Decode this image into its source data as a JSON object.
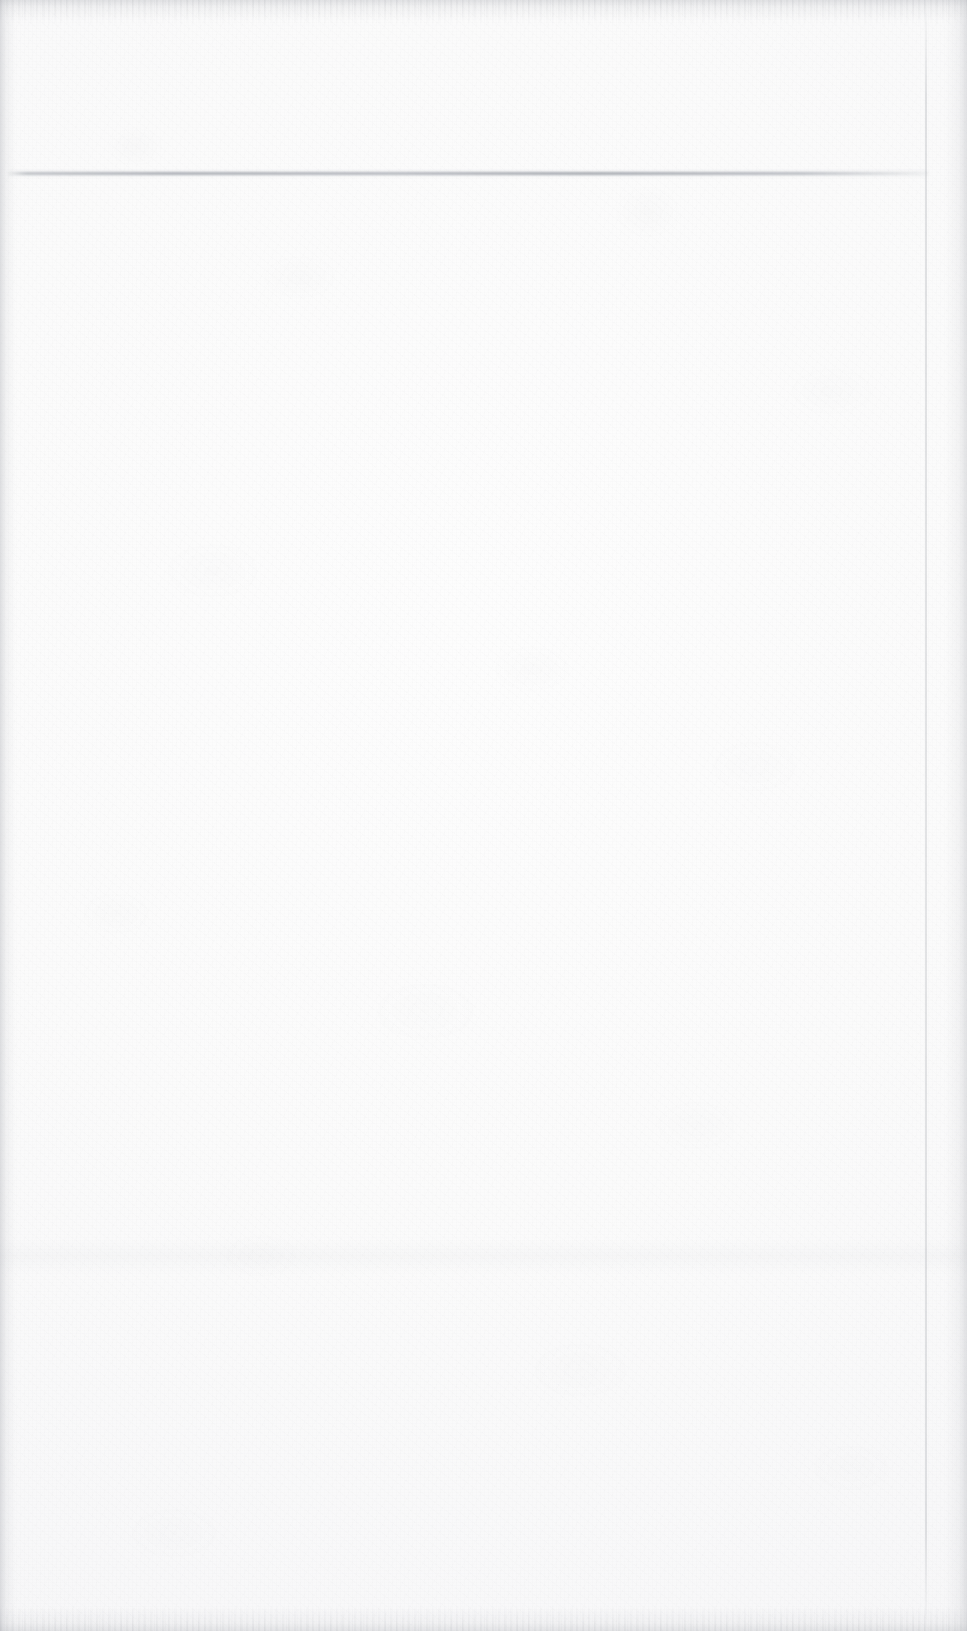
{
  "page": {
    "kind": "scanned-blank-sheet",
    "width": 967,
    "height": 1631,
    "text_content": "",
    "background_color": "#fbfbfb",
    "paper_tone": "#fdfdfd",
    "grain_color": "#96989e"
  },
  "marks": {
    "horizontal_rule": {
      "label": "",
      "color": "#a6a9b0",
      "x": 8,
      "y": 172,
      "width": 920,
      "thickness": 3
    },
    "tonal_band": {
      "label": "",
      "color": "#a8abb2",
      "y": 1238,
      "height": 36
    },
    "right_seam": {
      "label": "",
      "color": "#abaeb4",
      "x": 925
    }
  },
  "edges": {
    "vignette_color": "#b0b2b8",
    "speckle_color": "#989ba2"
  }
}
